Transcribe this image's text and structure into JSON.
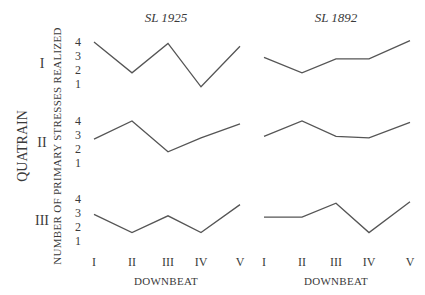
{
  "chart_data": {
    "type": "line",
    "title": "",
    "column_titles": [
      "SL 1925",
      "SL 1892"
    ],
    "row_labels": [
      "I",
      "II",
      "III"
    ],
    "row_axis_label": "QUATRAIN",
    "ylabel": "NUMBER OF PRIMARY STRESSES REALIZED",
    "xlabel": "DOWNBEAT",
    "categories": [
      "I",
      "II",
      "III",
      "IV",
      "V"
    ],
    "yticks": [
      1,
      2,
      3,
      4
    ],
    "ylim": [
      1,
      4
    ],
    "grid": false,
    "legend": "none",
    "panels": [
      {
        "quatrain": "I",
        "source": "SL 1925",
        "values": [
          4.0,
          1.8,
          3.9,
          0.8,
          3.7
        ]
      },
      {
        "quatrain": "I",
        "source": "SL 1892",
        "values": [
          2.9,
          1.8,
          2.8,
          2.8,
          4.1
        ]
      },
      {
        "quatrain": "II",
        "source": "SL 1925",
        "values": [
          2.7,
          4.0,
          1.8,
          2.8,
          3.8
        ]
      },
      {
        "quatrain": "II",
        "source": "SL 1892",
        "values": [
          2.9,
          4.0,
          2.9,
          2.8,
          3.9
        ]
      },
      {
        "quatrain": "III",
        "source": "SL 1925",
        "values": [
          2.9,
          1.6,
          2.8,
          1.6,
          3.6
        ]
      },
      {
        "quatrain": "III",
        "source": "SL 1892",
        "values": [
          2.7,
          2.7,
          3.7,
          1.6,
          3.8
        ]
      }
    ]
  },
  "labels": {
    "col_left": "SL 1925",
    "col_right": "SL 1892",
    "quatrain": "QUATRAIN",
    "ylabel": "NUMBER OF PRIMARY STRESSES REALIZED",
    "xlabel_left": "DOWNBEAT",
    "xlabel_right": "DOWNBEAT",
    "row1": "I",
    "row2": "II",
    "row3": "III",
    "ticks": [
      "4",
      "3",
      "2",
      "1"
    ],
    "xcats": [
      "I",
      "II",
      "III",
      "IV",
      "V"
    ]
  },
  "layout": {
    "panel_top_y4": [
      42,
      121,
      199
    ],
    "unit_px": 14,
    "left_x": [
      94,
      132,
      168,
      201,
      240
    ],
    "right_x": [
      264,
      302,
      336,
      369,
      410
    ]
  }
}
